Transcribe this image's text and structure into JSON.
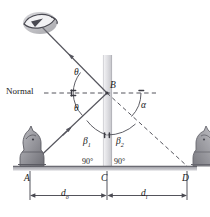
{
  "figure": {
    "colors": {
      "line": "#4a4a52",
      "ray": "#5a5a62",
      "mirror_light": "#e8e8ea",
      "mirror_dark": "#c9c9cd",
      "ground": "#a8a8ac",
      "text": "#1a1a1a",
      "piece": "#9b9ba0"
    }
  },
  "labels": {
    "normal": "Normal",
    "theta_incident": "θ",
    "theta_reflected": "θ",
    "alpha": "α",
    "beta1": "β",
    "beta1_sub": "1",
    "beta2": "β",
    "beta2_sub": "2",
    "point_a": "A",
    "point_b": "B",
    "point_c": "C",
    "point_d": "D",
    "right_angle_left": "90°",
    "right_angle_right": "90°",
    "d_object": "d",
    "d_object_sub": "o",
    "d_image": "d",
    "d_image_sub": "i"
  },
  "objects": {
    "observer": "eye-icon",
    "real_object": "chess-knight-object",
    "virtual_image": "chess-knight-image",
    "mirror": "plane-mirror",
    "ground": "ground-line"
  }
}
